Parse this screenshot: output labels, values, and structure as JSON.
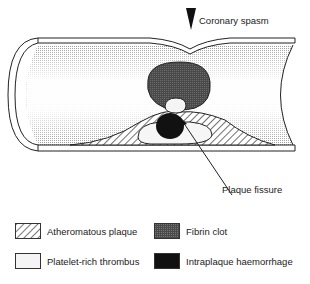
{
  "diagram": {
    "annotations": {
      "spasm_label": "Coronary spasm",
      "fissure_label": "Plaque fissure"
    }
  },
  "legend": {
    "items": [
      {
        "label": "Atheromatous plaque",
        "pattern": "hatched",
        "color": "#ffffff"
      },
      {
        "label": "Fibrin clot",
        "pattern": "stippled",
        "color": "#555555"
      },
      {
        "label": "Platelet-rich thrombus",
        "pattern": "solid",
        "color": "#f4f4f4"
      },
      {
        "label": "Intraplaque haemorrhage",
        "pattern": "solid",
        "color": "#111111"
      }
    ]
  }
}
